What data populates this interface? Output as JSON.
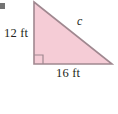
{
  "figure": {
    "type": "right-triangle-diagram",
    "background_color": "#ffffff",
    "fill_color": "#f5ccd6",
    "stroke_color": "#a08890",
    "text_color": "#231f20",
    "labels": {
      "vertical_leg": "12 ft",
      "horizontal_leg": "16 ft",
      "hypotenuse": "c"
    },
    "right_angle_marker": {
      "present": true,
      "position": "bottom-left-vertex",
      "size_px": 9
    },
    "vertices": {
      "apex": [
        34,
        2
      ],
      "right_angle": [
        34,
        64
      ],
      "base_right": [
        112,
        64
      ]
    },
    "bullet_artifact": {
      "present": true,
      "position": [
        0,
        3
      ]
    }
  }
}
